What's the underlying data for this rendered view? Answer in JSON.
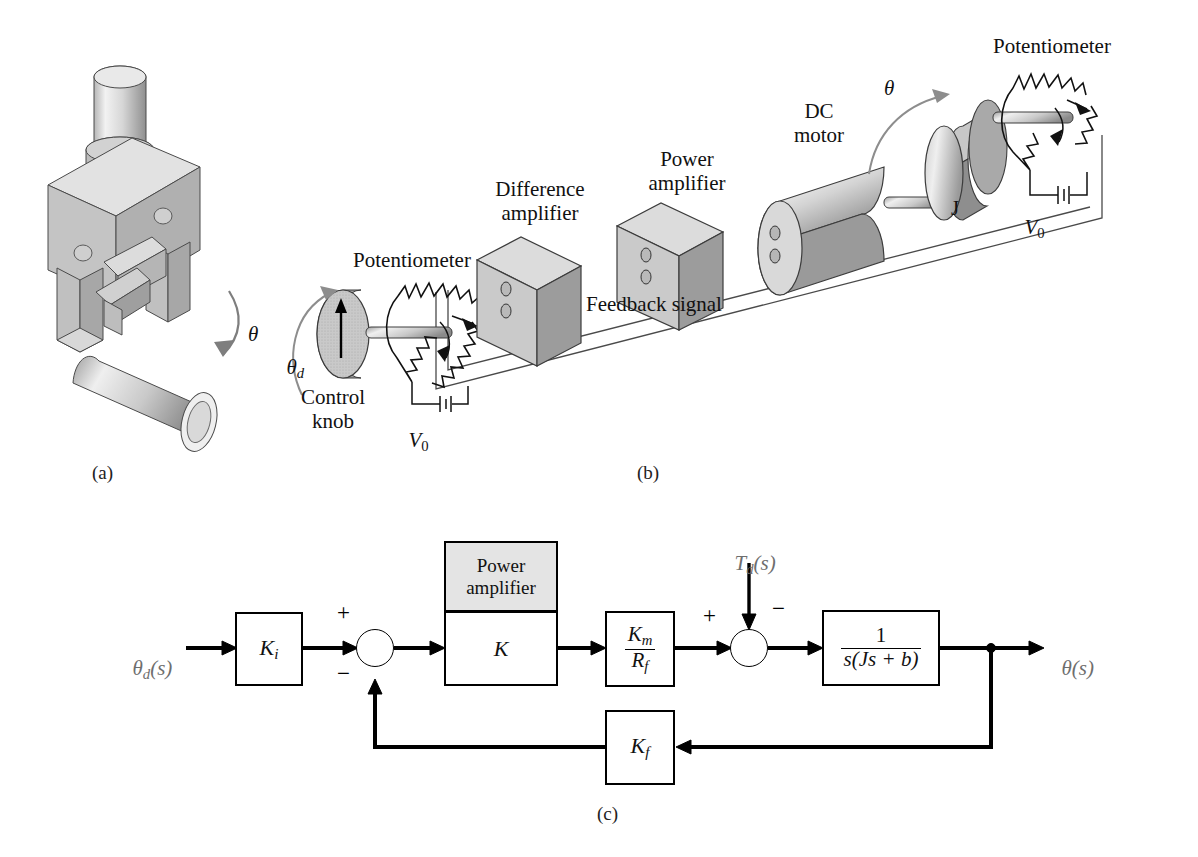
{
  "figure": {
    "panels": [
      {
        "id": "a",
        "label": "(a)",
        "caption_x": 95,
        "caption_y": 462
      },
      {
        "id": "b",
        "label": "(b)",
        "caption_x": 640,
        "caption_y": 462
      },
      {
        "id": "c",
        "label": "(c)",
        "caption_x": 600,
        "caption_y": 805
      }
    ]
  },
  "panel_a": {
    "name": "robot-gripper-assembly",
    "angle_symbol": "θ",
    "items": [
      "gripper-body",
      "gripper-jaws",
      "actuator-cylinder",
      "workpiece-cylinder"
    ]
  },
  "panel_b": {
    "name": "physical-system-schematic",
    "labels": {
      "potentiometer_left": "Potentiometer",
      "potentiometer_right": "Potentiometer",
      "difference_amplifier": "Difference\namplifier",
      "power_amplifier": "Power\namplifier",
      "dc_motor": "DC\nmotor",
      "control_knob": "Control\nknob",
      "feedback_signal": "Feedback signal",
      "inertia": "J",
      "theta_d": "θ",
      "theta_d_sub": "d",
      "theta": "θ",
      "voltage_left": "V",
      "voltage_left_sub": "0",
      "voltage_right": "V",
      "voltage_right_sub": "0"
    }
  },
  "panel_c": {
    "name": "control-block-diagram",
    "input_signal": {
      "base": "θ",
      "sub": "d",
      "tail": "(s)"
    },
    "output_signal": {
      "base": "θ",
      "sub": "",
      "tail": "(s)"
    },
    "disturbance": {
      "base": "T",
      "sub": "d",
      "tail": "(s)"
    },
    "blocks": [
      {
        "name": "ki-block",
        "label_base": "K",
        "label_sub": "i",
        "x": 235,
        "y": 612,
        "w": 68,
        "h": 74
      },
      {
        "name": "power-amplifier-block",
        "header": "Power\namplifier",
        "label_base": "K",
        "label_sub": "",
        "x": 444,
        "y": 541,
        "w": 114,
        "h": 145,
        "header_h": 70
      },
      {
        "name": "km-rf-block",
        "numerator_base": "K",
        "numerator_sub": "m",
        "denominator_base": "R",
        "denominator_sub": "f",
        "x": 605,
        "y": 611,
        "w": 70,
        "h": 76
      },
      {
        "name": "plant-block",
        "numerator": "1",
        "denominator": "s(Js + b)",
        "x": 822,
        "y": 610,
        "w": 118,
        "h": 76
      },
      {
        "name": "kf-block",
        "label_base": "K",
        "label_sub": "f",
        "x": 605,
        "y": 710,
        "w": 70,
        "h": 75
      }
    ],
    "summing_junctions": [
      {
        "name": "error-summing-junction",
        "cx": 375,
        "cy": 648,
        "r": 19,
        "signs": [
          {
            "s": "+",
            "pos": "top-left"
          },
          {
            "s": "−",
            "pos": "bottom-left"
          }
        ]
      },
      {
        "name": "disturbance-summing-junction",
        "cx": 749,
        "cy": 648,
        "r": 19,
        "signs": [
          {
            "s": "+",
            "pos": "top-left"
          },
          {
            "s": "−",
            "pos": "top-right"
          }
        ]
      }
    ],
    "colors": {
      "line": "#000000",
      "block_fill": "#ffffff",
      "header_fill": "#e4e4e4",
      "signal_label": "#6e6e6e"
    }
  }
}
